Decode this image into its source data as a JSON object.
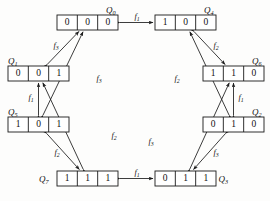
{
  "figure": {
    "type": "state-transition-diagram"
  },
  "states": [
    {
      "id": "Q0",
      "name": "Q",
      "subscript": "0",
      "bits": [
        "0",
        "0",
        "0"
      ],
      "label_pos": "top-right",
      "box": {
        "x": 57,
        "y": 15,
        "w": 61,
        "h": 15
      }
    },
    {
      "id": "Q4",
      "name": "Q",
      "subscript": "4",
      "bits": [
        "1",
        "0",
        "0"
      ],
      "label_pos": "top-right",
      "box": {
        "x": 155,
        "y": 15,
        "w": 61,
        "h": 15
      }
    },
    {
      "id": "Q1",
      "name": "Q",
      "subscript": "1",
      "bits": [
        "0",
        "0",
        "1"
      ],
      "label_pos": "top-left",
      "box": {
        "x": 8,
        "y": 66,
        "w": 61,
        "h": 15
      }
    },
    {
      "id": "Q6",
      "name": "Q",
      "subscript": "6",
      "bits": [
        "1",
        "1",
        "0"
      ],
      "label_pos": "top-right",
      "box": {
        "x": 203,
        "y": 66,
        "w": 61,
        "h": 15
      }
    },
    {
      "id": "Q5",
      "name": "Q",
      "subscript": "5",
      "bits": [
        "1",
        "0",
        "1"
      ],
      "label_pos": "top-left",
      "box": {
        "x": 8,
        "y": 117,
        "w": 61,
        "h": 15
      }
    },
    {
      "id": "Q2",
      "name": "Q",
      "subscript": "2",
      "bits": [
        "0",
        "1",
        "0"
      ],
      "label_pos": "top-right",
      "box": {
        "x": 203,
        "y": 117,
        "w": 61,
        "h": 15
      }
    },
    {
      "id": "Q7",
      "name": "Q",
      "subscript": "7",
      "bits": [
        "1",
        "1",
        "1"
      ],
      "label_pos": "left",
      "box": {
        "x": 57,
        "y": 171,
        "w": 61,
        "h": 15
      }
    },
    {
      "id": "Q3",
      "name": "Q",
      "subscript": "3",
      "bits": [
        "0",
        "1",
        "1"
      ],
      "label_pos": "right",
      "box": {
        "x": 155,
        "y": 171,
        "w": 61,
        "h": 15
      }
    }
  ],
  "edges": [
    {
      "from": "Q0",
      "to": "Q4",
      "label": "f",
      "subscript": "1",
      "label_x": 137,
      "label_y": 19,
      "kind": "horizontal"
    },
    {
      "from": "Q7",
      "to": "Q3",
      "label": "f",
      "subscript": "1",
      "label_x": 137,
      "label_y": 175,
      "kind": "horizontal"
    },
    {
      "from": "Q5",
      "to": "Q1",
      "label": "f",
      "subscript": "1",
      "label_x": 31,
      "label_y": 100,
      "kind": "vertical"
    },
    {
      "from": "Q2",
      "to": "Q6",
      "label": "f",
      "subscript": "1",
      "label_x": 241,
      "label_y": 100,
      "kind": "vertical"
    },
    {
      "from": "Q1",
      "to": "Q0",
      "label": "f",
      "subscript": "3",
      "label_x": 56,
      "label_y": 48,
      "kind": "diagonal"
    },
    {
      "from": "Q4",
      "to": "Q6",
      "label": "f",
      "subscript": "2",
      "label_x": 216,
      "label_y": 48,
      "kind": "diagonal"
    },
    {
      "from": "Q5",
      "to": "Q0",
      "label": "f",
      "subscript": "3",
      "label_x": 99,
      "label_y": 81,
      "kind": "diagonal"
    },
    {
      "from": "Q2",
      "to": "Q4",
      "label": "f",
      "subscript": "2",
      "label_x": 177,
      "label_y": 81,
      "kind": "diagonal"
    },
    {
      "from": "Q7",
      "to": "Q1",
      "label": "f",
      "subscript": "2",
      "label_x": 114,
      "label_y": 138,
      "kind": "diagonal"
    },
    {
      "from": "Q3",
      "to": "Q6",
      "label": "f",
      "subscript": "3",
      "label_x": 151,
      "label_y": 144,
      "kind": "diagonal"
    },
    {
      "from": "Q5",
      "to": "Q7",
      "label": "f",
      "subscript": "2",
      "label_x": 57,
      "label_y": 155,
      "kind": "diagonal"
    },
    {
      "from": "Q2",
      "to": "Q3",
      "label": "f",
      "subscript": "3",
      "label_x": 216,
      "label_y": 155,
      "kind": "diagonal"
    }
  ],
  "colors": {
    "ink": "#111111",
    "stroke": "#1a1a1a",
    "background": "#fdfdfc",
    "box_fill": "#ffffff"
  }
}
